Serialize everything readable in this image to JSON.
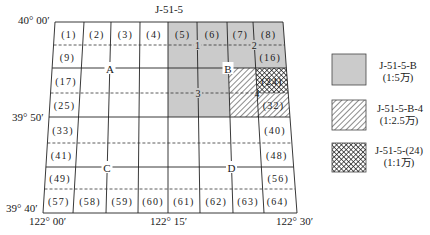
{
  "colors": {
    "sheet_fill_1_50000": "#cbcbcb",
    "line": "#222222",
    "hatch": "#1a1a1a",
    "background": "#ffffff"
  },
  "map": {
    "title": "J-51-5",
    "lat_labels": {
      "top": "40° 00′",
      "middle": "39° 50′",
      "bottom": "39° 40′"
    },
    "lon_labels": {
      "left": "122° 00′",
      "middle": "122° 15′",
      "right": "122° 30′"
    },
    "quadrants": {
      "a": "A",
      "b": "B",
      "c": "C",
      "d": "D"
    },
    "sub_quadrants": {
      "s1": "1",
      "s2": "2",
      "s3": "3",
      "s4": "4"
    },
    "cells": {
      "c1": "(1)",
      "c2": "(2)",
      "c3": "(3)",
      "c4": "(4)",
      "c5": "(5)",
      "c6": "(6)",
      "c7": "(7)",
      "c8": "(8)",
      "c9": "(9)",
      "c16": "(16)",
      "c17": "(17)",
      "c24": "(24)",
      "c25": "(25)",
      "c32": "(32)",
      "c33": "(33)",
      "c40": "(40)",
      "c41": "(41)",
      "c48": "(48)",
      "c49": "(49)",
      "c56": "(56)",
      "c57": "(57)",
      "c58": "(58)",
      "c59": "(59)",
      "c60": "(60)",
      "c61": "(61)",
      "c62": "(62)",
      "c63": "(63)",
      "c64": "(64)"
    }
  },
  "legend": {
    "items": [
      {
        "code": "J-51-5-B",
        "scale": "(1:5万)",
        "pattern": "gray-fill"
      },
      {
        "code": "J-51-5-B-4",
        "scale": "(1:2.5万)",
        "pattern": "diagonal-hatch"
      },
      {
        "code": "J-51-5-(24)",
        "scale": "(1:1万)",
        "pattern": "cross-hatch"
      }
    ]
  }
}
